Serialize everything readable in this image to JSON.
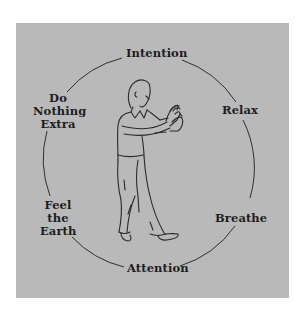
{
  "diagram": {
    "background_color": "#b9b9b9",
    "line_color": "#2a2a2a",
    "center_figure": "standing person in tai chi posture, hands raised in front of chest",
    "labels": {
      "top": {
        "lines": [
          "Intention"
        ]
      },
      "upper_right": {
        "lines": [
          "Relax"
        ]
      },
      "lower_right": {
        "lines": [
          "Breathe"
        ]
      },
      "bottom": {
        "lines": [
          "Attention"
        ]
      },
      "lower_left": {
        "lines": [
          "Feel",
          "the",
          "Earth"
        ]
      },
      "upper_left": {
        "lines": [
          "Do",
          "Nothing",
          "Extra"
        ]
      }
    }
  }
}
